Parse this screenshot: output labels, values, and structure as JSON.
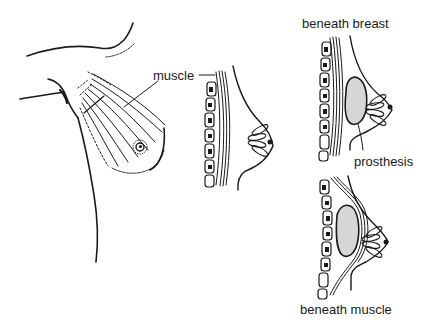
{
  "figure": {
    "panels": [
      {
        "id": "front-view",
        "description": "front view of chest showing pectoral muscle fibers"
      },
      {
        "id": "side-view-normal",
        "description": "side cross-section showing ribs, muscle and breast"
      },
      {
        "id": "side-view-subglandular",
        "description": "prosthesis placed beneath breast"
      },
      {
        "id": "side-view-submuscular",
        "description": "prosthesis placed beneath muscle"
      }
    ],
    "labels": {
      "muscle": "muscle",
      "beneath_breast": "beneath breast",
      "prosthesis": "prosthesis",
      "beneath_muscle": "beneath muscle"
    },
    "colors": {
      "ink": "#1a1a1a",
      "background": "#ffffff"
    }
  }
}
